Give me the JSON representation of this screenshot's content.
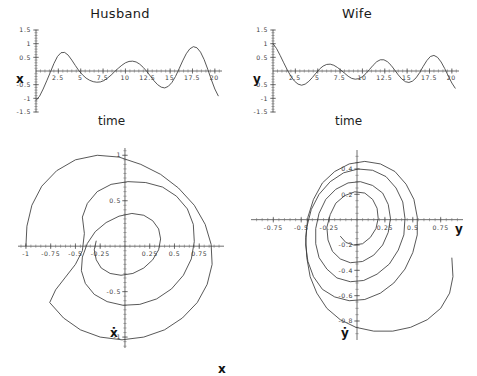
{
  "figure": {
    "background": "#ffffff",
    "curve_color": "#3a3a3a",
    "axis_color": "#4a4a4a",
    "width": 477,
    "height": 376
  },
  "panels": {
    "husband_time": {
      "title": "Husband",
      "xlabel": "time",
      "ylabel": "x"
    },
    "wife_time": {
      "title": "Wife",
      "xlabel": "time",
      "ylabel": "y"
    },
    "husband_phase": {
      "xlabel": "x",
      "ylabel": "ẋ"
    },
    "wife_phase": {
      "xlabel": "y",
      "ylabel": "ẏ"
    }
  },
  "chart_data": [
    {
      "id": "husband_time",
      "type": "line",
      "title": "Husband",
      "xlabel": "time",
      "ylabel": "x",
      "xlim": [
        0,
        20.8
      ],
      "ylim": [
        -1.5,
        1.5
      ],
      "xticks": [
        2.5,
        5,
        7.5,
        10,
        12.5,
        15,
        17.5,
        20
      ],
      "xticklabels": [
        "2.5",
        "5",
        "7.5",
        "10",
        "12.5",
        "15",
        "17.5",
        "20"
      ],
      "yticks": [
        -1.5,
        -1,
        -0.5,
        0.5,
        1,
        1.5
      ],
      "yticklabels": [
        "-1.5",
        "-1",
        "-0.5",
        "0.5",
        "1",
        "1.5"
      ],
      "grid": false,
      "legend": "none",
      "series": [
        {
          "name": "x(t)",
          "x": [
            0,
            0.4,
            0.8,
            1.2,
            1.6,
            2.0,
            2.4,
            2.8,
            3.2,
            3.6,
            4.0,
            4.4,
            4.8,
            5.2,
            5.6,
            6.0,
            6.4,
            6.8,
            7.2,
            7.6,
            8.0,
            8.4,
            8.8,
            9.2,
            9.6,
            10.0,
            10.4,
            10.8,
            11.2,
            11.6,
            12.0,
            12.4,
            12.8,
            13.2,
            13.6,
            14.0,
            14.4,
            14.8,
            15.2,
            15.6,
            16.0,
            16.4,
            16.8,
            17.2,
            17.6,
            18.0,
            18.4,
            18.8,
            19.2,
            19.6,
            20.0,
            20.4
          ],
          "values": [
            -1.08,
            -0.92,
            -0.66,
            -0.36,
            -0.05,
            0.27,
            0.53,
            0.67,
            0.68,
            0.58,
            0.4,
            0.2,
            0.01,
            -0.14,
            -0.26,
            -0.34,
            -0.39,
            -0.41,
            -0.4,
            -0.35,
            -0.26,
            -0.15,
            -0.02,
            0.1,
            0.21,
            0.3,
            0.35,
            0.36,
            0.33,
            0.25,
            0.13,
            -0.02,
            -0.19,
            -0.36,
            -0.5,
            -0.59,
            -0.62,
            -0.56,
            -0.42,
            -0.2,
            0.08,
            0.37,
            0.63,
            0.81,
            0.89,
            0.85,
            0.69,
            0.42,
            0.07,
            -0.31,
            -0.66,
            -0.92
          ]
        }
      ]
    },
    {
      "id": "wife_time",
      "type": "line",
      "title": "Wife",
      "xlabel": "time",
      "ylabel": "y",
      "xlim": [
        0,
        20.8
      ],
      "ylim": [
        -1.5,
        1.5
      ],
      "xticks": [
        2.5,
        5,
        7.5,
        10,
        12.5,
        15,
        17.5,
        20
      ],
      "xticklabels": [
        "2.5",
        "5",
        "7.5",
        "10",
        "12.5",
        "15",
        "17.5",
        "20"
      ],
      "yticks": [
        -1.5,
        -1,
        -0.5,
        0.5,
        1,
        1.5
      ],
      "yticklabels": [
        "-1.5",
        "-1",
        "-0.5",
        "0.5",
        "1",
        "1.5"
      ],
      "grid": false,
      "legend": "none",
      "series": [
        {
          "name": "y(t)",
          "x": [
            0,
            0.4,
            0.8,
            1.2,
            1.6,
            2.0,
            2.4,
            2.8,
            3.2,
            3.6,
            4.0,
            4.4,
            4.8,
            5.2,
            5.6,
            6.0,
            6.4,
            6.8,
            7.2,
            7.6,
            8.0,
            8.4,
            8.8,
            9.2,
            9.6,
            10.0,
            10.4,
            10.8,
            11.2,
            11.6,
            12.0,
            12.4,
            12.8,
            13.2,
            13.6,
            14.0,
            14.4,
            14.8,
            15.2,
            15.6,
            16.0,
            16.4,
            16.8,
            17.2,
            17.6,
            18.0,
            18.4,
            18.8,
            19.2,
            19.6,
            20.0,
            20.4
          ],
          "values": [
            1.0,
            0.82,
            0.57,
            0.3,
            0.04,
            -0.19,
            -0.37,
            -0.48,
            -0.52,
            -0.48,
            -0.38,
            -0.24,
            -0.08,
            0.07,
            0.18,
            0.24,
            0.25,
            0.21,
            0.13,
            0.03,
            -0.08,
            -0.19,
            -0.27,
            -0.3,
            -0.28,
            -0.21,
            -0.09,
            0.06,
            0.21,
            0.34,
            0.41,
            0.41,
            0.34,
            0.21,
            0.04,
            -0.14,
            -0.29,
            -0.39,
            -0.42,
            -0.37,
            -0.25,
            -0.06,
            0.17,
            0.38,
            0.53,
            0.57,
            0.5,
            0.33,
            0.09,
            -0.18,
            -0.44,
            -0.64
          ]
        }
      ]
    },
    {
      "id": "husband_phase",
      "type": "line",
      "title": "",
      "xlabel": "x",
      "ylabel": "ẋ",
      "xlim": [
        -1.08,
        1.0
      ],
      "ylim": [
        -1.12,
        1.08
      ],
      "xticks": [
        -1,
        -0.75,
        -0.5,
        -0.25,
        0.25,
        0.5,
        0.75
      ],
      "xticklabels": [
        "-1",
        "-0.75",
        "-0.5",
        "-0.25",
        "0.25",
        "0.5",
        "0.75"
      ],
      "yticks": [
        -1,
        -0.5,
        0.5,
        1
      ],
      "yticklabels": [
        "-1",
        "-0.5",
        "0.5",
        "1"
      ],
      "grid": false,
      "legend": "none",
      "description": "inward spiral phase portrait of x versus x-dot, starting at left edge near (-1,0) and winding clockwise toward the origin",
      "series": [
        {
          "name": "x vs xdot",
          "points": [
            [
              -1.0,
              0.0
            ],
            [
              -0.99,
              0.22
            ],
            [
              -0.94,
              0.45
            ],
            [
              -0.84,
              0.66
            ],
            [
              -0.69,
              0.83
            ],
            [
              -0.5,
              0.95
            ],
            [
              -0.28,
              1.0
            ],
            [
              -0.06,
              0.98
            ],
            [
              0.16,
              0.9
            ],
            [
              0.36,
              0.79
            ],
            [
              0.54,
              0.64
            ],
            [
              0.7,
              0.45
            ],
            [
              0.81,
              0.24
            ],
            [
              0.87,
              0.02
            ],
            [
              0.88,
              -0.2
            ],
            [
              0.83,
              -0.42
            ],
            [
              0.73,
              -0.62
            ],
            [
              0.58,
              -0.79
            ],
            [
              0.4,
              -0.92
            ],
            [
              0.19,
              -1.0
            ],
            [
              -0.03,
              -1.03
            ],
            [
              -0.25,
              -1.0
            ],
            [
              -0.45,
              -0.92
            ],
            [
              -0.62,
              -0.79
            ],
            [
              -0.76,
              -0.62
            ],
            [
              -0.7,
              -0.48
            ],
            [
              -0.6,
              -0.34
            ],
            [
              -0.5,
              -0.2
            ],
            [
              -0.43,
              -0.05
            ],
            [
              -0.41,
              0.14
            ],
            [
              -0.43,
              0.32
            ],
            [
              -0.38,
              0.47
            ],
            [
              -0.28,
              0.6
            ],
            [
              -0.14,
              0.68
            ],
            [
              0.03,
              0.71
            ],
            [
              0.21,
              0.7
            ],
            [
              0.38,
              0.65
            ],
            [
              0.52,
              0.55
            ],
            [
              0.63,
              0.41
            ],
            [
              0.69,
              0.24
            ],
            [
              0.7,
              0.05
            ],
            [
              0.67,
              -0.14
            ],
            [
              0.59,
              -0.32
            ],
            [
              0.47,
              -0.47
            ],
            [
              0.32,
              -0.58
            ],
            [
              0.15,
              -0.64
            ],
            [
              -0.02,
              -0.65
            ],
            [
              -0.18,
              -0.61
            ],
            [
              -0.31,
              -0.53
            ],
            [
              -0.4,
              -0.41
            ],
            [
              -0.44,
              -0.27
            ],
            [
              -0.43,
              -0.12
            ],
            [
              -0.38,
              0.03
            ],
            [
              -0.3,
              0.16
            ],
            [
              -0.19,
              0.26
            ],
            [
              -0.06,
              0.33
            ],
            [
              0.07,
              0.36
            ],
            [
              0.19,
              0.34
            ],
            [
              0.28,
              0.28
            ],
            [
              0.34,
              0.19
            ],
            [
              0.36,
              0.08
            ],
            [
              0.34,
              -0.04
            ],
            [
              0.28,
              -0.15
            ],
            [
              0.19,
              -0.24
            ],
            [
              0.08,
              -0.3
            ],
            [
              -0.04,
              -0.32
            ],
            [
              -0.15,
              -0.3
            ],
            [
              -0.24,
              -0.24
            ],
            [
              -0.29,
              -0.15
            ],
            [
              -0.31,
              -0.04
            ],
            [
              -0.29,
              0.06
            ]
          ]
        }
      ]
    },
    {
      "id": "wife_phase",
      "type": "line",
      "title": "",
      "xlabel": "y",
      "ylabel": "ẏ",
      "xlim": [
        -0.95,
        0.95
      ],
      "ylim": [
        -0.95,
        0.55
      ],
      "xticks": [
        -0.75,
        -0.5,
        -0.25,
        0.25,
        0.5,
        0.75
      ],
      "xticklabels": [
        "-0.75",
        "-0.5",
        "-0.25",
        "0.25",
        "0.5",
        "0.75"
      ],
      "yticks": [
        -0.8,
        -0.6,
        -0.4,
        -0.2,
        0.2,
        0.4
      ],
      "yticklabels": [
        "-0.8",
        "-0.6",
        "-0.4",
        "-0.2",
        "0.2",
        "0.4"
      ],
      "grid": false,
      "legend": "none",
      "description": "inward spiral phase portrait of y versus y-dot, entering from lower right and winding toward the origin",
      "series": [
        {
          "name": "y vs ydot",
          "points": [
            [
              0.85,
              -0.3
            ],
            [
              0.86,
              -0.45
            ],
            [
              0.83,
              -0.58
            ],
            [
              0.75,
              -0.7
            ],
            [
              0.63,
              -0.79
            ],
            [
              0.48,
              -0.85
            ],
            [
              0.32,
              -0.88
            ],
            [
              0.15,
              -0.88
            ],
            [
              -0.01,
              -0.85
            ],
            [
              -0.15,
              -0.79
            ],
            [
              -0.27,
              -0.7
            ],
            [
              -0.36,
              -0.58
            ],
            [
              -0.42,
              -0.45
            ],
            [
              -0.45,
              -0.3
            ],
            [
              -0.46,
              -0.14
            ],
            [
              -0.44,
              0.02
            ],
            [
              -0.39,
              0.16
            ],
            [
              -0.31,
              0.29
            ],
            [
              -0.2,
              0.38
            ],
            [
              -0.07,
              0.44
            ],
            [
              0.07,
              0.46
            ],
            [
              0.21,
              0.44
            ],
            [
              0.34,
              0.38
            ],
            [
              0.44,
              0.28
            ],
            [
              0.51,
              0.16
            ],
            [
              0.54,
              0.02
            ],
            [
              0.54,
              -0.12
            ],
            [
              0.5,
              -0.26
            ],
            [
              0.43,
              -0.39
            ],
            [
              0.33,
              -0.5
            ],
            [
              0.21,
              -0.58
            ],
            [
              0.07,
              -0.63
            ],
            [
              -0.07,
              -0.64
            ],
            [
              -0.2,
              -0.61
            ],
            [
              -0.31,
              -0.55
            ],
            [
              -0.39,
              -0.45
            ],
            [
              -0.44,
              -0.33
            ],
            [
              -0.46,
              -0.2
            ],
            [
              -0.45,
              -0.06
            ],
            [
              -0.41,
              0.08
            ],
            [
              -0.34,
              0.2
            ],
            [
              -0.24,
              0.3
            ],
            [
              -0.12,
              0.37
            ],
            [
              0.01,
              0.4
            ],
            [
              0.14,
              0.39
            ],
            [
              0.26,
              0.34
            ],
            [
              0.35,
              0.25
            ],
            [
              0.41,
              0.14
            ],
            [
              0.43,
              0.01
            ],
            [
              0.42,
              -0.12
            ],
            [
              0.37,
              -0.24
            ],
            [
              0.29,
              -0.35
            ],
            [
              0.18,
              -0.43
            ],
            [
              0.06,
              -0.48
            ],
            [
              -0.06,
              -0.49
            ],
            [
              -0.18,
              -0.46
            ],
            [
              -0.27,
              -0.39
            ],
            [
              -0.34,
              -0.3
            ],
            [
              -0.37,
              -0.19
            ],
            [
              -0.37,
              -0.07
            ],
            [
              -0.34,
              0.05
            ],
            [
              -0.28,
              0.16
            ],
            [
              -0.19,
              0.24
            ],
            [
              -0.08,
              0.29
            ],
            [
              0.03,
              0.3
            ],
            [
              0.14,
              0.27
            ],
            [
              0.23,
              0.21
            ],
            [
              0.28,
              0.12
            ],
            [
              0.3,
              0.01
            ],
            [
              0.28,
              -0.1
            ],
            [
              0.23,
              -0.2
            ],
            [
              0.15,
              -0.28
            ],
            [
              0.05,
              -0.33
            ],
            [
              -0.06,
              -0.34
            ],
            [
              -0.15,
              -0.31
            ],
            [
              -0.22,
              -0.25
            ],
            [
              -0.26,
              -0.16
            ],
            [
              -0.27,
              -0.06
            ],
            [
              -0.24,
              0.04
            ],
            [
              -0.19,
              0.13
            ],
            [
              -0.11,
              0.19
            ],
            [
              -0.02,
              0.22
            ],
            [
              0.07,
              0.21
            ],
            [
              0.14,
              0.16
            ],
            [
              0.18,
              0.09
            ],
            [
              0.19,
              0.01
            ],
            [
              0.17,
              -0.07
            ],
            [
              0.12,
              -0.14
            ],
            [
              0.05,
              -0.19
            ],
            [
              -0.03,
              -0.2
            ],
            [
              -0.1,
              -0.18
            ],
            [
              -0.15,
              -0.13
            ]
          ]
        }
      ]
    }
  ]
}
